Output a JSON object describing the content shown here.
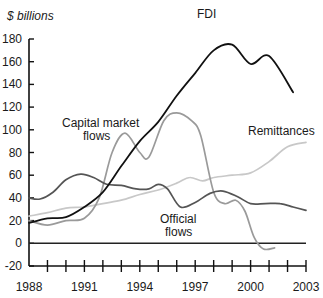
{
  "chart_data": {
    "type": "line",
    "title": "",
    "ylabel": "$ billions",
    "xlabel": "",
    "ylim": [
      -20,
      180
    ],
    "xlim": [
      1988,
      2003
    ],
    "grid": false,
    "legend": "inline annotations",
    "y_ticks": [
      180,
      160,
      140,
      120,
      100,
      80,
      60,
      40,
      20,
      0,
      -20
    ],
    "x_tick_labels": [
      1988,
      1991,
      1994,
      1997,
      2000,
      2003
    ],
    "series": [
      {
        "name": "FDI",
        "color": "#111111",
        "x": [
          1988,
          1989,
          1990,
          1991,
          1992,
          1993,
          1994,
          1995,
          1996,
          1997,
          1998,
          1999,
          2000,
          2001,
          2002.3
        ],
        "values": [
          18,
          22,
          23,
          32,
          45,
          68,
          90,
          107,
          130,
          150,
          170,
          175,
          158,
          165,
          133
        ]
      },
      {
        "name": "Capital market flows",
        "color": "#9a9a9a",
        "x": [
          1988,
          1989,
          1990,
          1991,
          1991.8,
          1992.5,
          1993.2,
          1994,
          1994.5,
          1995.3,
          1996,
          1996.8,
          1997.3,
          1998,
          1998.6,
          1999.2,
          1999.7,
          2000.2,
          2000.7,
          2001.3
        ],
        "values": [
          20,
          16,
          20,
          22,
          40,
          80,
          97,
          80,
          76,
          108,
          115,
          108,
          95,
          45,
          35,
          38,
          28,
          5,
          -5,
          -4
        ]
      },
      {
        "name": "Official flows",
        "color": "#555555",
        "x": [
          1988,
          1988.6,
          1989.3,
          1990,
          1990.8,
          1991.5,
          1992.2,
          1993,
          1993.8,
          1994.5,
          1995,
          1995.5,
          1996.2,
          1997,
          1997.8,
          1998.5,
          1999.3,
          2000,
          2000.8,
          2001.6,
          2002.3,
          2003
        ],
        "values": [
          40,
          39,
          45,
          56,
          61,
          58,
          52,
          51,
          48,
          48,
          52,
          48,
          32,
          36,
          44,
          46,
          41,
          35,
          35,
          35,
          32,
          29
        ]
      },
      {
        "name": "Remittances",
        "color": "#c8c8c8",
        "x": [
          1988,
          1989,
          1990,
          1991,
          1992,
          1993,
          1994,
          1995,
          1996,
          1996.7,
          1997.4,
          1998,
          1999,
          2000,
          2001,
          2002,
          2003
        ],
        "values": [
          24,
          27,
          31,
          32,
          35,
          38,
          43,
          47,
          53,
          58,
          55,
          58,
          60,
          62,
          72,
          85,
          89
        ]
      }
    ],
    "annotations": [
      {
        "text": "FDI",
        "series": "FDI"
      },
      {
        "text": "Capital market flows",
        "series": "Capital market flows"
      },
      {
        "text": "Official flows",
        "series": "Official flows"
      },
      {
        "text": "Remittances",
        "series": "Remittances"
      }
    ]
  },
  "labels": {
    "unit": "$ billions",
    "fdi": "FDI",
    "capital_line1": "Capital market",
    "capital_line2": "flows",
    "official_line1": "Official",
    "official_line2": "flows",
    "remittances": "Remittances"
  }
}
